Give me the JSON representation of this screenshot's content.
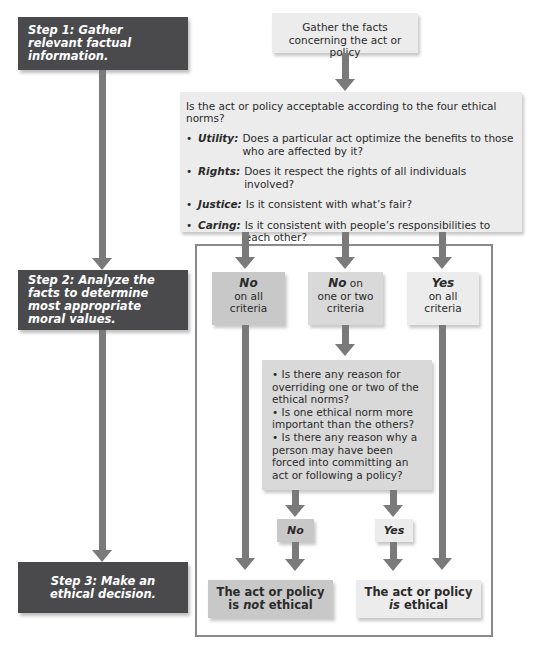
{
  "steps": [
    {
      "label": "Step 1:",
      "text": "Gather relevant factual information."
    },
    {
      "label": "Step 2:",
      "text": "Analyze the facts to determine most appropriate moral values."
    },
    {
      "label": "Step 3:",
      "text": "Make an ethical decision."
    }
  ],
  "facts_box": {
    "text": "Gather the facts concerning the act or policy"
  },
  "norms_box": {
    "question": "Is the act or policy acceptable according to the four ethical norms?",
    "norms": [
      {
        "term": "Utility:",
        "text": "Does a particular act optimize the benefits to those who are affected by it?"
      },
      {
        "term": "Rights:",
        "text": "Does it respect the rights of all individuals involved?"
      },
      {
        "term": "Justice:",
        "text": "Is it consistent with what’s fair?"
      },
      {
        "term": "Caring:",
        "text": "Is it consistent with people’s responsibilities to each other?"
      }
    ]
  },
  "outcomes": [
    {
      "head": "No",
      "tail": "on all criteria",
      "tail_inline": ""
    },
    {
      "head": "No",
      "tail_inline": "on",
      "tail": "one or two criteria"
    },
    {
      "head": "Yes",
      "tail": "on all criteria",
      "tail_inline": ""
    }
  ],
  "questions_box": {
    "items": [
      "Is there any reason for overriding one or two of the ethical norms?",
      "Is one ethical norm more important than the others?",
      "Is there any reason why a person may have been forced into committing an act or following a policy?"
    ]
  },
  "answers": {
    "no": "No",
    "yes": "Yes"
  },
  "decisions": {
    "not_ethical": {
      "line1": "The act or policy",
      "pre": "is",
      "emph": "not",
      "post": "ethical"
    },
    "ethical": {
      "line1": "The act or policy",
      "emph": "is",
      "post": "ethical"
    }
  },
  "colors": {
    "step_box": "#4a4a4c",
    "arrow": "#7a7a7a",
    "light_box": "#ececec",
    "mid_box": "#d9d9d9",
    "dark_box": "#c8c8c8",
    "frame": "#8a8a8a"
  }
}
